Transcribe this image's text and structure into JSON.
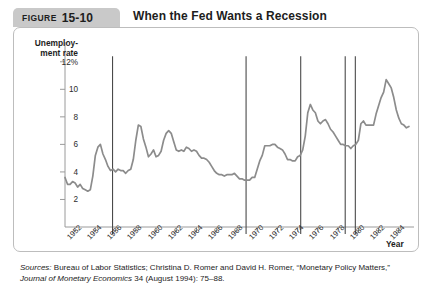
{
  "header": {
    "figure_label": "FIGURE",
    "figure_number": "15-10",
    "title": "When the Fed Wants a Recession"
  },
  "source": {
    "prefix": "Sources:",
    "line1_rest": " Bureau of Labor Statistics; Christina D. Romer and David H. Romer, “Monetary",
    "line2_a": "Policy Matters,” ",
    "line2_italic": "Journal of Monetary Economics",
    "line2_b": " 34 (August 1994): 75–88."
  },
  "chart_data": {
    "type": "line",
    "title": "When the Fed Wants a Recession",
    "xlabel": "Year",
    "ylabel": "Unemploy-\nment rate",
    "ylabel_line1": "Unemploy-",
    "ylabel_line2": "ment rate",
    "grid": false,
    "legend": "none",
    "xlim": [
      1951.0,
      1985.5
    ],
    "ylim": [
      0,
      13
    ],
    "yticks": [
      2,
      4,
      6,
      8,
      10,
      12
    ],
    "ytick_labels": [
      "2",
      "4",
      "6",
      "8",
      "10",
      "12%"
    ],
    "xticks": [
      1952,
      1954,
      1956,
      1958,
      1960,
      1962,
      1964,
      1966,
      1968,
      1970,
      1972,
      1974,
      1976,
      1978,
      1980,
      1982,
      1984
    ],
    "xtick_labels": [
      "1952",
      "1954",
      "1956",
      "1958",
      "1960",
      "1962",
      "1964",
      "1966",
      "1968",
      "1970",
      "1972",
      "1974",
      "1976",
      "1978",
      "1980",
      "1982",
      "1984"
    ],
    "line_color": "#8c8c8c",
    "marker_line_color": "#4a4a4a",
    "axis_color": "#9a9a9a",
    "contraction_years": [
      1955.7,
      1968.9,
      1974.3,
      1978.7,
      1979.7
    ],
    "series": [
      {
        "name": "Unemployment rate",
        "x": [
          1951.0,
          1951.25,
          1951.5,
          1951.75,
          1952.0,
          1952.25,
          1952.5,
          1952.75,
          1953.0,
          1953.25,
          1953.5,
          1953.75,
          1954.0,
          1954.25,
          1954.5,
          1954.75,
          1955.0,
          1955.25,
          1955.5,
          1955.75,
          1956.0,
          1956.25,
          1956.5,
          1956.75,
          1957.0,
          1957.25,
          1957.5,
          1957.75,
          1958.0,
          1958.25,
          1958.5,
          1958.75,
          1959.0,
          1959.25,
          1959.5,
          1959.75,
          1960.0,
          1960.25,
          1960.5,
          1960.75,
          1961.0,
          1961.25,
          1961.5,
          1961.75,
          1962.0,
          1962.25,
          1962.5,
          1962.75,
          1963.0,
          1963.25,
          1963.5,
          1963.75,
          1964.0,
          1964.25,
          1964.5,
          1964.75,
          1965.0,
          1965.25,
          1965.5,
          1965.75,
          1966.0,
          1966.25,
          1966.5,
          1966.75,
          1967.0,
          1967.25,
          1967.5,
          1967.75,
          1968.0,
          1968.25,
          1968.5,
          1968.75,
          1969.0,
          1969.25,
          1969.5,
          1969.75,
          1970.0,
          1970.25,
          1970.5,
          1970.75,
          1971.0,
          1971.25,
          1971.5,
          1971.75,
          1972.0,
          1972.25,
          1972.5,
          1972.75,
          1973.0,
          1973.25,
          1973.5,
          1973.75,
          1974.0,
          1974.25,
          1974.5,
          1974.75,
          1975.0,
          1975.25,
          1975.5,
          1975.75,
          1976.0,
          1976.25,
          1976.5,
          1976.75,
          1977.0,
          1977.25,
          1977.5,
          1977.75,
          1978.0,
          1978.25,
          1978.5,
          1978.75,
          1979.0,
          1979.25,
          1979.5,
          1979.75,
          1980.0,
          1980.25,
          1980.5,
          1980.75,
          1981.0,
          1981.25,
          1981.5,
          1981.75,
          1982.0,
          1982.25,
          1982.5,
          1982.75,
          1983.0,
          1983.25,
          1983.5,
          1983.75,
          1984.0,
          1984.25,
          1984.5,
          1984.75,
          1985.0
        ],
        "y": [
          3.6,
          3.1,
          3.1,
          3.3,
          3.2,
          2.9,
          3.1,
          2.8,
          2.7,
          2.6,
          2.7,
          3.7,
          5.2,
          5.8,
          6.0,
          5.3,
          4.9,
          4.4,
          4.1,
          4.2,
          4.0,
          4.2,
          4.1,
          4.1,
          3.9,
          4.1,
          4.2,
          4.9,
          6.3,
          7.4,
          7.3,
          6.4,
          5.8,
          5.1,
          5.3,
          5.6,
          5.1,
          5.2,
          5.5,
          6.3,
          6.8,
          7.0,
          6.8,
          6.2,
          5.6,
          5.5,
          5.6,
          5.5,
          5.8,
          5.7,
          5.5,
          5.6,
          5.5,
          5.2,
          5.0,
          5.0,
          4.9,
          4.7,
          4.4,
          4.1,
          3.9,
          3.8,
          3.8,
          3.7,
          3.8,
          3.8,
          3.8,
          3.9,
          3.7,
          3.5,
          3.5,
          3.4,
          3.4,
          3.4,
          3.6,
          3.6,
          4.2,
          4.8,
          5.2,
          5.9,
          5.9,
          5.9,
          6.0,
          6.0,
          5.8,
          5.7,
          5.6,
          5.3,
          4.9,
          4.9,
          4.8,
          4.8,
          5.1,
          5.2,
          5.6,
          6.6,
          8.3,
          8.9,
          8.5,
          8.3,
          7.7,
          7.5,
          7.7,
          7.8,
          7.5,
          7.1,
          6.9,
          6.6,
          6.3,
          6.0,
          6.0,
          5.9,
          5.9,
          5.7,
          5.9,
          6.0,
          6.3,
          7.5,
          7.7,
          7.4,
          7.4,
          7.4,
          7.4,
          8.2,
          8.8,
          9.4,
          9.8,
          10.7,
          10.4,
          10.1,
          9.4,
          8.5,
          7.9,
          7.5,
          7.4,
          7.2,
          7.3
        ]
      }
    ]
  }
}
